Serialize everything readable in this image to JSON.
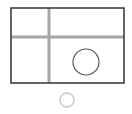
{
  "canvas": {
    "width": 132,
    "height": 114,
    "background": "#ffffff"
  },
  "frame": {
    "x": 11,
    "y": 8,
    "width": 113,
    "height": 75,
    "stroke": "#333333",
    "stroke_width": 1.5
  },
  "grid_lines": {
    "color": "#a6a6a6",
    "width": 3,
    "vertical": {
      "x": 49,
      "y1": 8,
      "y2": 83
    },
    "horizontal": {
      "y": 37,
      "x1": 11,
      "x2": 124
    }
  },
  "inner_circle": {
    "cx": 86,
    "cy": 62,
    "r": 13,
    "stroke": "#555555",
    "stroke_width": 1.2
  },
  "radio_circle": {
    "cx": 67,
    "cy": 100,
    "r": 7,
    "stroke": "#c8c8c8",
    "stroke_width": 1.5
  }
}
